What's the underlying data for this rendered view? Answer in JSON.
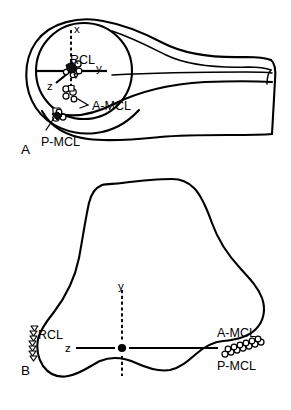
{
  "figure": {
    "background_color": "#ffffff",
    "line_color": "#000000",
    "width": 291,
    "height": 410,
    "type": "anatomical-line-diagram"
  },
  "panels": [
    {
      "id": "A",
      "label": "A",
      "view": "lateral",
      "axes": [
        {
          "name": "x",
          "label": "x",
          "direction": "up",
          "style": "dashed"
        },
        {
          "name": "y",
          "label": "y",
          "direction": "right",
          "style": "solid"
        },
        {
          "name": "z",
          "label": "z",
          "direction": "lower-left",
          "style": "solid"
        }
      ],
      "annotations": [
        {
          "name": "rcl",
          "label": "RCL",
          "marker": "cluster"
        },
        {
          "name": "a-mcl",
          "label": "A-MCL",
          "marker": "cluster"
        },
        {
          "name": "p-mcl",
          "label": "P-MCL",
          "marker": "cluster"
        }
      ]
    },
    {
      "id": "B",
      "label": "B",
      "view": "anterior",
      "axes": [
        {
          "name": "y",
          "label": "y",
          "direction": "up",
          "style": "dashed"
        },
        {
          "name": "z",
          "label": "z",
          "direction": "horizontal",
          "style": "solid"
        }
      ],
      "annotations": [
        {
          "name": "rcl",
          "label": "RCL",
          "marker": "triangle-chain"
        },
        {
          "name": "a-mcl",
          "label": "A-MCL",
          "marker": "circle-chain"
        },
        {
          "name": "p-mcl",
          "label": "P-MCL",
          "marker": "circle-chain"
        }
      ]
    }
  ],
  "labels": {
    "panel_a": "A",
    "panel_b": "B",
    "rcl": "RCL",
    "a_mcl": "A-MCL",
    "p_mcl": "P-MCL",
    "axis_x": "x",
    "axis_y": "y",
    "axis_z": "z"
  }
}
